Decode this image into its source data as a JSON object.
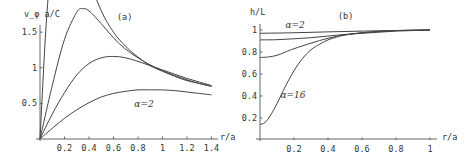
{
  "chart_data": [
    {
      "type": "line",
      "panel_label": "(a)",
      "title": "",
      "xlabel": "r/a",
      "ylabel": "v_φ a/C",
      "xlim": [
        0,
        1.45
      ],
      "ylim": [
        0,
        3.3
      ],
      "xticks": [
        0.2,
        0.4,
        0.6,
        0.8,
        1,
        1.2,
        1.4
      ],
      "xtick_labels": [
        "0.2",
        "0.4",
        "0.6",
        "0.8",
        "1",
        "1.2",
        "1.4"
      ],
      "yticks": [
        0.5,
        1,
        1.5,
        2,
        2.5,
        3
      ],
      "ytick_labels": [
        "0.5",
        "1",
        "1.5",
        "2",
        "2.5",
        "3"
      ],
      "grid": false,
      "annotations": [
        {
          "text": "α=16",
          "x": 0.33,
          "y": 3.08
        },
        {
          "text": "α=2",
          "x": 0.77,
          "y": 0.45
        }
      ],
      "series": [
        {
          "name": "α=16",
          "x": [
            0,
            0.05,
            0.1,
            0.15,
            0.2,
            0.25,
            0.3,
            0.4,
            0.5,
            0.6,
            0.7,
            0.8,
            0.9,
            1.0,
            1.1,
            1.2,
            1.3,
            1.4
          ],
          "y": [
            0,
            1.6,
            2.6,
            3.05,
            3.15,
            3.05,
            2.8,
            2.25,
            1.8,
            1.5,
            1.3,
            1.15,
            1.03,
            0.95,
            0.88,
            0.82,
            0.78,
            0.74
          ]
        },
        {
          "name": "α=8",
          "x": [
            0,
            0.1,
            0.2,
            0.3,
            0.35,
            0.4,
            0.5,
            0.6,
            0.7,
            0.8,
            0.9,
            1.0,
            1.1,
            1.2,
            1.3,
            1.4
          ],
          "y": [
            0,
            0.75,
            1.4,
            1.78,
            1.83,
            1.8,
            1.62,
            1.42,
            1.26,
            1.14,
            1.04,
            0.96,
            0.89,
            0.83,
            0.78,
            0.74
          ]
        },
        {
          "name": "α=4",
          "x": [
            0,
            0.1,
            0.2,
            0.3,
            0.4,
            0.5,
            0.6,
            0.7,
            0.8,
            0.9,
            1.0,
            1.1,
            1.2,
            1.3,
            1.4
          ],
          "y": [
            0,
            0.35,
            0.65,
            0.9,
            1.06,
            1.14,
            1.16,
            1.14,
            1.09,
            1.03,
            0.97,
            0.91,
            0.85,
            0.8,
            0.75
          ]
        },
        {
          "name": "α=2",
          "x": [
            0,
            0.1,
            0.2,
            0.3,
            0.4,
            0.5,
            0.6,
            0.7,
            0.8,
            0.9,
            1.0,
            1.1,
            1.2,
            1.3,
            1.4
          ],
          "y": [
            0,
            0.15,
            0.29,
            0.41,
            0.51,
            0.59,
            0.64,
            0.67,
            0.69,
            0.69,
            0.69,
            0.68,
            0.66,
            0.64,
            0.62
          ]
        }
      ]
    },
    {
      "type": "line",
      "panel_label": "(b)",
      "title": "",
      "xlabel": "r/a",
      "ylabel": "h/L",
      "xlim": [
        0,
        1.04
      ],
      "ylim": [
        0,
        1.06
      ],
      "xticks": [
        0.2,
        0.4,
        0.6,
        0.8,
        1
      ],
      "xtick_labels": [
        "0.2",
        "0.4",
        "0.6",
        "0.8",
        "1"
      ],
      "yticks": [
        0.2,
        0.4,
        0.6,
        0.8,
        1
      ],
      "ytick_labels": [
        "0.2",
        "0.4",
        "0.6",
        "0.8",
        "1"
      ],
      "grid": false,
      "annotations": [
        {
          "text": "α=2",
          "x": 0.15,
          "y": 1.02
        },
        {
          "text": "α=16",
          "x": 0.12,
          "y": 0.38
        }
      ],
      "series": [
        {
          "name": "α=2",
          "x": [
            0,
            0.2,
            0.4,
            0.6,
            0.8,
            1.0
          ],
          "y": [
            0.97,
            0.975,
            0.983,
            0.99,
            0.995,
            1.0
          ]
        },
        {
          "name": "α=4",
          "x": [
            0,
            0.1,
            0.2,
            0.3,
            0.4,
            0.5,
            0.6,
            0.7,
            0.8,
            0.9,
            1.0
          ],
          "y": [
            0.91,
            0.912,
            0.92,
            0.93,
            0.945,
            0.96,
            0.97,
            0.98,
            0.99,
            0.995,
            1.0
          ]
        },
        {
          "name": "α=8",
          "x": [
            0,
            0.05,
            0.1,
            0.15,
            0.2,
            0.3,
            0.4,
            0.5,
            0.6,
            0.7,
            0.8,
            0.9,
            1.0
          ],
          "y": [
            0.75,
            0.755,
            0.77,
            0.8,
            0.83,
            0.88,
            0.925,
            0.955,
            0.975,
            0.988,
            0.995,
            0.998,
            1.0
          ]
        },
        {
          "name": "α=16",
          "x": [
            0,
            0.03,
            0.06,
            0.1,
            0.15,
            0.2,
            0.25,
            0.3,
            0.35,
            0.4,
            0.45,
            0.5,
            0.6,
            0.7,
            0.8,
            0.9,
            1.0
          ],
          "y": [
            0.14,
            0.16,
            0.22,
            0.33,
            0.49,
            0.63,
            0.74,
            0.82,
            0.87,
            0.91,
            0.935,
            0.955,
            0.975,
            0.988,
            0.995,
            0.998,
            1.0
          ]
        }
      ]
    }
  ]
}
